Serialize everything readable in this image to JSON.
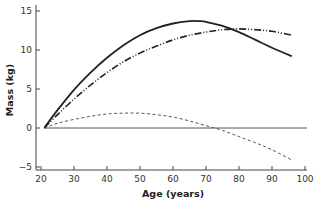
{
  "chart_data": {
    "type": "line",
    "title": "",
    "xlabel": "Age (years)",
    "ylabel": "Mass (kg)",
    "xlim": [
      20,
      100
    ],
    "ylim": [
      -5,
      15
    ],
    "xticks": [
      20,
      30,
      40,
      50,
      60,
      70,
      80,
      90,
      100
    ],
    "yticks": [
      -5,
      0,
      5,
      10,
      15
    ],
    "grid": false,
    "legend": null,
    "reference_line": {
      "y": 0,
      "style": "solid-thin"
    },
    "series": [
      {
        "name": "solid",
        "style": "solid",
        "color": "#222222",
        "x": [
          21,
          25,
          30,
          35,
          40,
          45,
          50,
          55,
          60,
          65,
          68,
          70,
          75,
          80,
          85,
          90,
          96
        ],
        "values": [
          0,
          2.3,
          4.9,
          7.1,
          9.0,
          10.6,
          11.9,
          12.8,
          13.4,
          13.7,
          13.7,
          13.6,
          13.1,
          12.3,
          11.3,
          10.3,
          9.2
        ]
      },
      {
        "name": "dash-dot",
        "style": "dash-dot-dot",
        "color": "#222222",
        "x": [
          21,
          25,
          30,
          35,
          40,
          45,
          50,
          55,
          60,
          65,
          70,
          75,
          80,
          85,
          90,
          96
        ],
        "values": [
          0,
          1.7,
          3.7,
          5.5,
          7.1,
          8.5,
          9.6,
          10.5,
          11.3,
          11.9,
          12.3,
          12.6,
          12.7,
          12.6,
          12.4,
          11.9
        ]
      },
      {
        "name": "dashed",
        "style": "dashed",
        "color": "#444444",
        "x": [
          21,
          25,
          30,
          35,
          40,
          45,
          50,
          55,
          60,
          65,
          70,
          75,
          80,
          85,
          90,
          96
        ],
        "values": [
          0,
          0.6,
          1.1,
          1.5,
          1.8,
          1.9,
          1.9,
          1.7,
          1.4,
          0.9,
          0.3,
          -0.3,
          -1.1,
          -1.9,
          -2.8,
          -4.1
        ]
      }
    ]
  }
}
